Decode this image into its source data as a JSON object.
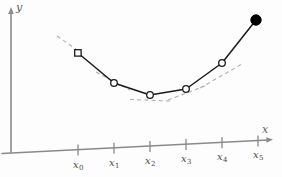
{
  "figure": {
    "title": ""
  },
  "axes": {
    "y_label": "y",
    "x_label": "x",
    "origin": {
      "x": 11,
      "y": 152
    },
    "y_axis_top": {
      "x": 11,
      "y": 10
    },
    "x_axis_end": {
      "x": 272,
      "y": 140
    },
    "y_label_pos": {
      "x": 15,
      "y": 2
    },
    "x_label_pos": {
      "x": 263,
      "y": 126
    },
    "axis_color": "#8a8a8a",
    "grid": false
  },
  "chart_data": {
    "type": "line",
    "title": "",
    "xlabel": "x",
    "ylabel": "y",
    "grid": false,
    "legend": null,
    "xlim": [
      0,
      282
    ],
    "ylim": [
      0,
      177
    ],
    "tick_labels": [
      "x0",
      "x1",
      "x2",
      "x3",
      "x4",
      "x5"
    ],
    "tick_labels_display": [
      "x₀",
      "x₁",
      "x₂",
      "x₃",
      "x₄",
      "x₅"
    ],
    "tick_positions_px": [
      78,
      114,
      150,
      186,
      222,
      258
    ],
    "x": [
      78,
      114,
      150,
      186,
      222,
      256
    ],
    "y": [
      53,
      83,
      95,
      89,
      63,
      20
    ],
    "point_styles": [
      "open",
      "open",
      "open",
      "open",
      "open",
      "filled"
    ],
    "series": [
      {
        "name": "interpolant",
        "style": "solid",
        "color": "#1a1a1a",
        "points": [
          {
            "x": 78,
            "y": 53,
            "label": "x0",
            "marker": "open-square"
          },
          {
            "x": 114,
            "y": 83,
            "label": "x1",
            "marker": "open-circle"
          },
          {
            "x": 150,
            "y": 95,
            "label": "x2",
            "marker": "open-circle"
          },
          {
            "x": 186,
            "y": 89,
            "label": "x3",
            "marker": "open-circle"
          },
          {
            "x": 222,
            "y": 63,
            "label": "x4",
            "marker": "open-circle"
          },
          {
            "x": 256,
            "y": 20,
            "label": "x5",
            "marker": "filled-circle"
          }
        ]
      }
    ],
    "tangents": [
      {
        "name": "tangent-at-x0",
        "x1": 57,
        "y1": 36,
        "x2": 80,
        "y2": 52
      },
      {
        "name": "tangent-at-x1",
        "x1": 96,
        "y1": 72,
        "x2": 130,
        "y2": 90
      },
      {
        "name": "tangent-at-x2",
        "x1": 130,
        "y1": 99,
        "x2": 170,
        "y2": 101
      },
      {
        "name": "tangent-at-x3",
        "x1": 168,
        "y1": 100,
        "x2": 205,
        "y2": 86
      },
      {
        "name": "tangent-at-x4",
        "x1": 200,
        "y1": 88,
        "x2": 242,
        "y2": 64
      }
    ],
    "marker_colors": {
      "open_fill": "#ffffff",
      "stroke": "#1a1a1a",
      "filled": "#000000"
    }
  }
}
